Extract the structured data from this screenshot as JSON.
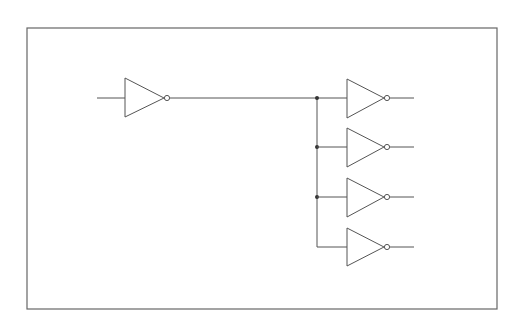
{
  "diagram": {
    "type": "logic-circuit",
    "colors": {
      "line": "#555555",
      "frame": "#666666",
      "background": "#ffffff",
      "junction": "#333333"
    },
    "frame": {
      "x": 27,
      "y": 28,
      "w": 470,
      "h": 281
    },
    "driver": {
      "name": "inverter-driver",
      "x": 125,
      "y": 98
    },
    "bus": {
      "x": 317,
      "y_top": 98,
      "y_bottom": 247
    },
    "loads": [
      {
        "name": "inverter-load-1",
        "y": 98,
        "junction": true
      },
      {
        "name": "inverter-load-2",
        "y": 147,
        "junction": true
      },
      {
        "name": "inverter-load-3",
        "y": 197,
        "junction": true
      },
      {
        "name": "inverter-load-4",
        "y": 247,
        "junction": false
      }
    ]
  }
}
